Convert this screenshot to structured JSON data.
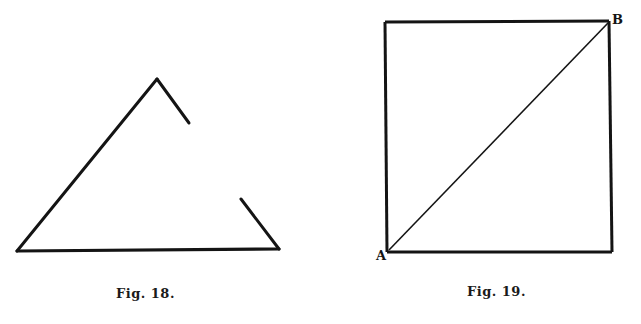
{
  "figures": [
    {
      "id": "fig18",
      "caption": "Fig. 18.",
      "shape": "triangle-with-gaps",
      "segments": [
        {
          "name": "left-side",
          "x1": 17,
          "y1": 251,
          "x2": 157,
          "y2": 79
        },
        {
          "name": "right-upper-stub",
          "x1": 157,
          "y1": 79,
          "x2": 189,
          "y2": 123
        },
        {
          "name": "right-lower-stub",
          "x1": 241,
          "y1": 199,
          "x2": 279,
          "y2": 249
        },
        {
          "name": "base",
          "x1": 17,
          "y1": 251,
          "x2": 279,
          "y2": 249
        }
      ]
    },
    {
      "id": "fig19",
      "caption": "Fig. 19.",
      "shape": "square-with-diagonal",
      "square": {
        "x": 385,
        "y": 22,
        "width": 227,
        "height": 230
      },
      "diagonal": {
        "x1": 388,
        "y1": 250,
        "x2": 608,
        "y2": 23
      },
      "labels": {
        "A": "A",
        "B": "B"
      }
    }
  ],
  "colors": {
    "ink": "#141414",
    "paper": "#ffffff"
  }
}
